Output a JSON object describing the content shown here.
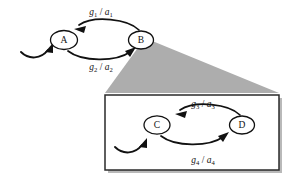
{
  "figure": {
    "type": "state-transition-diagram-with-magnified-inset",
    "background_color": "#ffffff",
    "line_color": "#111111",
    "wedge_color": "#adadad",
    "inset_border_color": "#2a2a2a"
  },
  "main_machine": {
    "nodes": [
      {
        "id": "A",
        "label": "A",
        "cx": 64,
        "cy": 40,
        "rx": 13.5,
        "ry": 9.5,
        "has_initial_arrow": true
      },
      {
        "id": "B",
        "label": "B",
        "cx": 141,
        "cy": 40,
        "rx": 12.5,
        "ry": 9.0,
        "has_initial_arrow": false
      }
    ],
    "transitions": [
      {
        "from": "B",
        "to": "A",
        "guard": "g",
        "guard_sub": "1",
        "action": "a",
        "action_sub": "1",
        "separator": "/",
        "label_x": 101,
        "label_y": 15,
        "direction": "right-to-left-upper-arc"
      },
      {
        "from": "A",
        "to": "B",
        "guard": "g",
        "guard_sub": "2",
        "action": "a",
        "action_sub": "2",
        "separator": "/",
        "label_x": 101,
        "label_y": 70,
        "direction": "left-to-right-lower-arc"
      }
    ]
  },
  "inset_machine": {
    "box": {
      "x": 105,
      "y": 95,
      "width": 174,
      "height": 75
    },
    "nodes": [
      {
        "id": "C",
        "label": "C",
        "cx": 157,
        "cy": 125,
        "rx": 13.0,
        "ry": 9.2,
        "has_initial_arrow": true
      },
      {
        "id": "D",
        "label": "D",
        "cx": 242,
        "cy": 125,
        "rx": 12.5,
        "ry": 9.0,
        "has_initial_arrow": false
      }
    ],
    "transitions": [
      {
        "from": "D",
        "to": "C",
        "guard": "g",
        "guard_sub": "3",
        "action": "a",
        "action_sub": "3",
        "separator": "/",
        "label_x": 203,
        "label_y": 107,
        "direction": "right-to-left-upper-arc"
      },
      {
        "from": "C",
        "to": "D",
        "guard": "g",
        "guard_sub": "4",
        "action": "a",
        "action_sub": "4",
        "separator": "/",
        "label_x": 203,
        "label_y": 163,
        "direction": "left-to-right-lower-arc"
      }
    ]
  },
  "callout": {
    "description": "gray wedge connecting node B region to the magnified inset box",
    "apex_x": 145,
    "apex_y": 40,
    "base_left_x": 105,
    "base_right_x": 279,
    "base_y": 93
  }
}
